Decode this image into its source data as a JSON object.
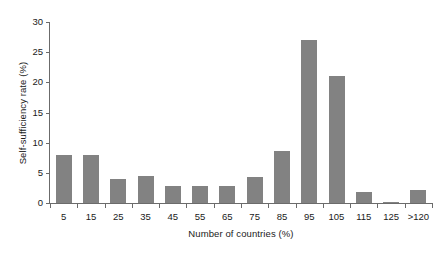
{
  "chart_data": {
    "type": "bar",
    "title": "",
    "subtitle": "",
    "xlabel": "Number of countries (%)",
    "ylabel": "Self-sufficiency rate (%)",
    "categories": [
      "5",
      "15",
      "25",
      "35",
      "45",
      "55",
      "65",
      "75",
      "85",
      "95",
      "105",
      "115",
      "125",
      ">120"
    ],
    "values": [
      7.9,
      7.9,
      4.0,
      4.4,
      2.9,
      2.9,
      2.9,
      4.3,
      8.7,
      27.0,
      21.0,
      1.8,
      0.2,
      2.1
    ],
    "ylim": [
      0,
      30
    ],
    "yticks": [
      0,
      5,
      10,
      15,
      20,
      25,
      30
    ],
    "ytick_labels": [
      "0",
      "5",
      "10",
      "15",
      "20",
      "25",
      "30"
    ],
    "grid": false,
    "legend": null,
    "legend_position": "none",
    "bar_color": "#828282",
    "axis_color": "#6b6b6b",
    "background": "#ffffff",
    "annotations": []
  }
}
